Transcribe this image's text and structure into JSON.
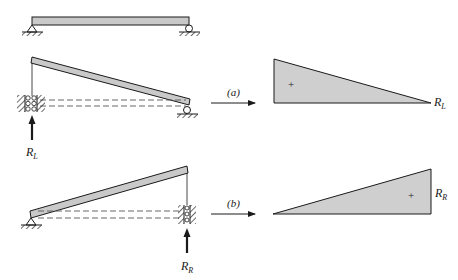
{
  "colors": {
    "beam_fill": "#c9c9c9",
    "triangle_fill": "#cfcfcf",
    "stroke": "#1a1a1a"
  },
  "top_beam": {
    "left_support": "pin",
    "right_support": "roller"
  },
  "case_a": {
    "label": "(a)",
    "reaction_label": "R",
    "reaction_sub": "L",
    "sign": "+",
    "diagram_label_main": "R",
    "diagram_label_sub": "L"
  },
  "case_b": {
    "label": "(b)",
    "reaction_label": "R",
    "reaction_sub": "R",
    "sign": "+",
    "diagram_label_main": "R",
    "diagram_label_sub": "R"
  }
}
